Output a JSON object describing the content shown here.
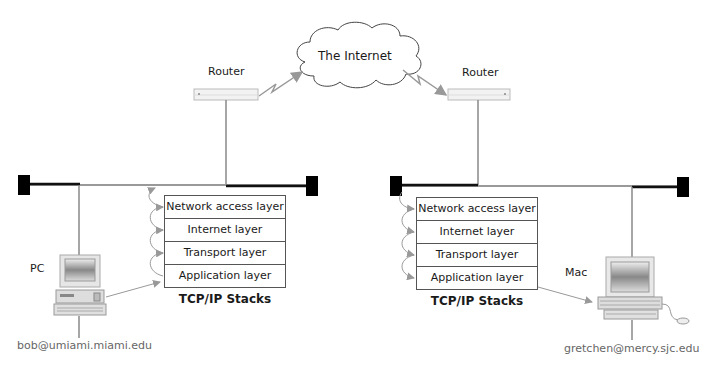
{
  "cloud": {
    "label": "The Internet"
  },
  "routers": [
    {
      "label": "Router"
    },
    {
      "label": "Router"
    }
  ],
  "left_network": {
    "host_label": "PC",
    "email": "bob@umiami.miami.edu",
    "stack_title": "TCP/IP Stacks",
    "layers": [
      "Network access layer",
      "Internet layer",
      "Transport layer",
      "Application layer"
    ]
  },
  "right_network": {
    "host_label": "Mac",
    "email": "gretchen@mercy.sjc.edu",
    "stack_title": "TCP/IP Stacks",
    "layers": [
      "Network access layer",
      "Internet layer",
      "Transport layer",
      "Application layer"
    ]
  },
  "colors": {
    "wire": "#8a8a8a",
    "bus": "#111111",
    "terminator": "#000000",
    "arrow": "#999999"
  }
}
